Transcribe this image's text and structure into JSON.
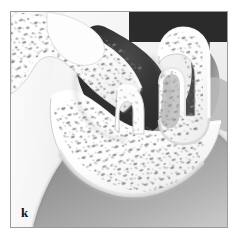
{
  "figure": {
    "label": "k",
    "caption": "",
    "kind": "anatomical-cross-section",
    "style": "grayscale airbrush medical illustration",
    "frame": {
      "border_color": "#9a9a9a",
      "border_width_px": 1,
      "x": 10,
      "y": 11,
      "width": 218,
      "height": 217
    },
    "palette": {
      "page_background": "#ffffff",
      "plate_background": "#f3f3f3",
      "bone_light": "#ffffff",
      "bone_shadow": "#d9d9d9",
      "cancellous_speckle": "#6f6f6f",
      "air_cavity_dark": "#2b2b2b",
      "air_cavity_mid": "#5a5a5a",
      "soft_tissue_gray": "#9d9d9d",
      "soft_tissue_light": "#c9c9c9",
      "label_color": "#111111"
    },
    "regions": [
      {
        "name": "left-soft-tissue-field",
        "tone": "light",
        "description": "pale gradient field occupying the left margin of the plate"
      },
      {
        "name": "upper-left-cancellous-bone",
        "tone": "white-with-speckles",
        "description": "spongy bone block with marrow spaces, upper left"
      },
      {
        "name": "central-air-sinus",
        "tone": "dark",
        "description": "large dark air-filled sinus cavity, upper center"
      },
      {
        "name": "middle-turbinate-hook",
        "tone": "white",
        "description": "small hook-shaped bony projection descending into the cavity, center"
      },
      {
        "name": "right-turbinate-scroll",
        "tone": "white-with-speckles",
        "description": "inverted-U scroll of bone on the right side"
      },
      {
        "name": "lower-cancellous-bone-body",
        "tone": "white-with-speckles",
        "description": "broad speckled bone body across the lower center"
      },
      {
        "name": "lower-soft-tissue-field",
        "tone": "mid-gray",
        "description": "graded gray soft tissue filling the lower portion of the plate"
      },
      {
        "name": "right-air-recess",
        "tone": "mid-dark",
        "description": "shaded recess to the right of the turbinate scroll"
      }
    ]
  }
}
